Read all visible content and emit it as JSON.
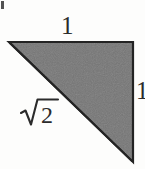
{
  "figure": {
    "kind": "geometry-diagram",
    "width": 145,
    "height": 169,
    "background_color": "#fdfdfc"
  },
  "shape": {
    "name": "right-triangle",
    "type": "polygon",
    "vertices": [
      {
        "id": "top-left",
        "x": 9,
        "y": 42
      },
      {
        "id": "top-right",
        "x": 133,
        "y": 42
      },
      {
        "id": "bottom-right",
        "x": 133,
        "y": 162
      }
    ],
    "fill_color": "#767676",
    "stroke_color": "#1f1f1f",
    "stroke_width": 2,
    "right_angle_vertex": "top-right"
  },
  "labels": {
    "top": {
      "text": "1",
      "side": "top-leg",
      "x": 75,
      "y": 29
    },
    "hypotenuse": {
      "text": "√2",
      "radicand": "2",
      "side": "hypotenuse",
      "x": 40,
      "y": 114
    },
    "right": {
      "text": "1",
      "side": "right-leg",
      "x": 140,
      "y": 93,
      "clipped": true
    }
  },
  "artifact": {
    "name": "scan-speck",
    "color": "#3a3a3a",
    "x": 1,
    "y": 1
  }
}
